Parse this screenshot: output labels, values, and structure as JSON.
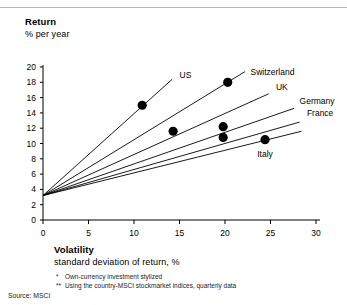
{
  "header": {
    "y_axis_title": "Return",
    "y_axis_subtitle": "% per year"
  },
  "xaxis_block": {
    "x_axis_title": "Volatility",
    "x_axis_subtitle": "standard deviation of return,   %"
  },
  "footnotes": {
    "note1_mark": "*",
    "note1_text": "Own-currency investment stylized",
    "note2_mark": "**",
    "note2_text": "Using the country-MSCI stockmarket indices, quarterly data",
    "source": "Source:  MSCI"
  },
  "chart_data": {
    "type": "line",
    "xlabel": "Volatility — standard deviation of return, %",
    "ylabel": "Return — % per year",
    "xlim": [
      0,
      30
    ],
    "ylim": [
      0,
      20
    ],
    "xticks": [
      0,
      5,
      10,
      15,
      20,
      25,
      30
    ],
    "yticks": [
      0,
      2,
      4,
      6,
      8,
      10,
      12,
      14,
      16,
      18,
      20
    ],
    "xtick_labels": [
      "0",
      "5",
      "10",
      "15",
      "20",
      "25",
      "30"
    ],
    "ytick_labels": [
      "0",
      "2",
      "4",
      "6",
      "8",
      "10",
      "12",
      "14",
      "16",
      "18",
      "20"
    ],
    "grid": false,
    "legend_position": "inline-right-of-line-ends",
    "common_origin": {
      "x": 0,
      "y": 3.2
    },
    "series": [
      {
        "name": "US",
        "label": "US",
        "line_end": {
          "x": 14.2,
          "y": 18.4
        },
        "label_point": {
          "x": 15.0,
          "y": 18.9
        },
        "marker": {
          "x": 10.9,
          "y": 15.0
        }
      },
      {
        "name": "Switzerland",
        "label": "Switzerland",
        "line_end": {
          "x": 22.2,
          "y": 19.4
        },
        "label_point": {
          "x": 22.8,
          "y": 19.4
        },
        "marker": {
          "x": 20.3,
          "y": 18.0
        }
      },
      {
        "name": "UK",
        "label": "UK",
        "line_end": {
          "x": 24.8,
          "y": 16.5
        },
        "label_point": {
          "x": 25.6,
          "y": 17.4
        },
        "marker": {
          "x": 19.8,
          "y": 12.2
        }
      },
      {
        "name": "Germany",
        "label": "Germany",
        "line_end": {
          "x": 27.6,
          "y": 14.6
        },
        "label_point": {
          "x": 28.2,
          "y": 15.5
        },
        "marker": {
          "x": 14.3,
          "y": 11.6
        }
      },
      {
        "name": "France",
        "label": "France",
        "line_end": {
          "x": 28.2,
          "y": 12.8
        },
        "label_point": {
          "x": 29.0,
          "y": 14.0
        },
        "marker": {
          "x": 19.8,
          "y": 10.8
        }
      },
      {
        "name": "Italy",
        "label": "Italy",
        "line_end": {
          "x": 28.4,
          "y": 11.6
        },
        "label_point": {
          "x": 24.4,
          "y": 8.6
        },
        "marker": {
          "x": 24.4,
          "y": 10.5
        }
      }
    ],
    "marker_color": "#000000",
    "line_color": "#000000",
    "axis_color": "#000000"
  }
}
